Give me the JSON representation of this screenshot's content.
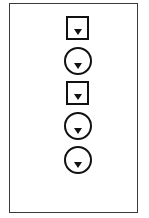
{
  "diagram": {
    "frame": {
      "border_color": "#3a3a3a",
      "background": "#ffffff"
    },
    "stroke_color": "#111111",
    "elements": [
      {
        "shape": "square",
        "icon": "down-triangle",
        "left": 66,
        "top": 16
      },
      {
        "shape": "circle",
        "icon": "down-triangle",
        "left": 64,
        "top": 47
      },
      {
        "shape": "square",
        "icon": "down-triangle",
        "left": 66,
        "top": 81
      },
      {
        "shape": "circle",
        "icon": "down-triangle",
        "left": 64,
        "top": 112
      },
      {
        "shape": "circle",
        "icon": "down-triangle",
        "left": 64,
        "top": 146
      }
    ]
  }
}
